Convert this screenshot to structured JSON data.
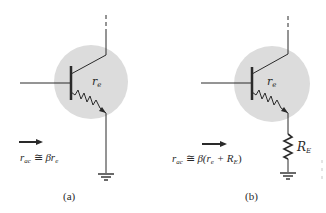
{
  "figure": {
    "panels": [
      {
        "id": "a",
        "caption": "(a)",
        "internal_resistor_label": {
          "base": "r",
          "sub": "e"
        },
        "formula": {
          "lhs_base": "r",
          "lhs_sub": "ac",
          "op": " ≅ ",
          "rhs": "βr",
          "rhs_sub": "e",
          "rhs_tail": ""
        },
        "has_external_emitter_resistor": false
      },
      {
        "id": "b",
        "caption": "(b)",
        "internal_resistor_label": {
          "base": "r",
          "sub": "e"
        },
        "external_resistor_label": {
          "base": "R",
          "sub": "E"
        },
        "formula": {
          "lhs_base": "r",
          "lhs_sub": "ac",
          "op": " ≅ ",
          "rhs": "β(r",
          "rhs_sub": "e",
          "rhs_mid": " + R",
          "rhs_mid_sub": "E",
          "rhs_tail": ")"
        },
        "has_external_emitter_resistor": true
      }
    ],
    "colors": {
      "line": "#2a2a2a",
      "circle_fill": "#dcdcdc",
      "background": "#ffffff"
    }
  }
}
